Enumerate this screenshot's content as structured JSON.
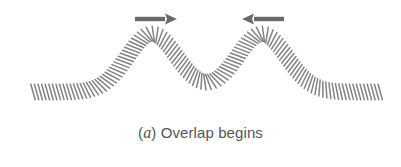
{
  "figure": {
    "caption": {
      "open_paren": "(",
      "label": "a",
      "close_paren": ")",
      "text": " Overlap begins"
    },
    "colors": {
      "coil": "#6e6e6e",
      "arrow": "#6a6a6a",
      "caption": "#555555",
      "background": "#ffffff"
    },
    "spring": {
      "x_start": 33,
      "x_end": 381,
      "baseline_y": 92,
      "coil_half_length": 8,
      "coil_spacing": 3.6,
      "pulses": [
        {
          "name": "pulse-left",
          "center_x": 152,
          "crest_y": 34,
          "width": 52,
          "direction": "right"
        },
        {
          "name": "pulse-right",
          "center_x": 262,
          "crest_y": 34,
          "width": 52,
          "direction": "left"
        }
      ]
    },
    "arrows": [
      {
        "name": "right-arrow",
        "direction": "right",
        "x1": 135,
        "x2": 177,
        "y": 19
      },
      {
        "name": "left-arrow",
        "direction": "left",
        "x1": 284,
        "x2": 242,
        "y": 19
      }
    ]
  }
}
